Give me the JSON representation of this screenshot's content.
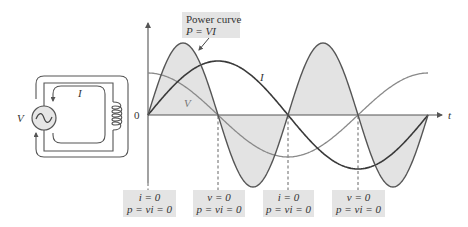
{
  "circuit": {
    "source_label": "V",
    "current_label": "I",
    "source_symbol": "~"
  },
  "graph": {
    "origin_label": "0",
    "time_axis_label": "t",
    "current_curve_label": "I",
    "voltage_curve_label": "V",
    "power_box": {
      "line1": "Power curve",
      "line2": "P = VI"
    },
    "annotations": [
      {
        "line1": "i = 0",
        "line2": "p = vi = 0"
      },
      {
        "line1": "v = 0",
        "line2": "p = vi = 0"
      },
      {
        "line1": "i = 0",
        "line2": "p = vi = 0"
      },
      {
        "line1": "v = 0",
        "line2": "p = vi = 0"
      }
    ],
    "colors": {
      "current": "#3a3a3a",
      "voltage": "#8a8a8a",
      "power": "#555555",
      "power_fill": "#e3e3e3",
      "axis": "#555555",
      "box_fill": "#e4e4e4"
    }
  },
  "chart_data": {
    "type": "line",
    "title": "Power curve P = VI",
    "xlabel": "t",
    "ylabel": "",
    "x_units": "quarter periods",
    "x": [
      0,
      0.5,
      1,
      1.5,
      2,
      2.5,
      3,
      3.5,
      4
    ],
    "series": [
      {
        "name": "I",
        "values": [
          0,
          0.71,
          1,
          0.71,
          0,
          -0.71,
          -1,
          -0.71,
          0
        ]
      },
      {
        "name": "V",
        "values": [
          1,
          0.71,
          0,
          -0.71,
          -1,
          -0.71,
          0,
          0.71,
          1
        ]
      },
      {
        "name": "P = VI",
        "values": [
          0,
          0.5,
          0,
          -0.5,
          0,
          0.5,
          0,
          -0.5,
          0
        ],
        "shaded": true
      }
    ],
    "annotations": [
      "i = 0, p = vi = 0 at t=0",
      "v = 0, p = vi = 0 at 1/4 period",
      "i = 0, p = vi = 0 at 1/2 period",
      "v = 0, p = vi = 0 at 3/4 period"
    ],
    "grid": false
  }
}
